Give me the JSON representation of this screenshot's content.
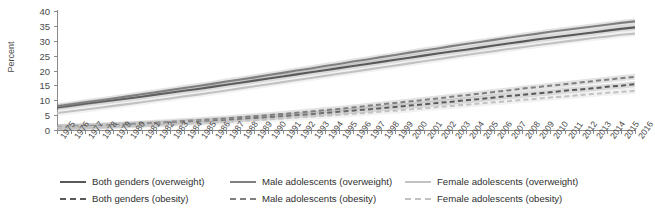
{
  "chart_data": {
    "type": "line",
    "title": "",
    "subtitle": "",
    "xlabel": "",
    "ylabel": "Percent",
    "ylim": [
      0,
      40
    ],
    "ytick_values": [
      0,
      5,
      10,
      15,
      20,
      25,
      30,
      35,
      40
    ],
    "grid": false,
    "legend_position": "bottom",
    "x": [
      1975,
      1976,
      1977,
      1978,
      1979,
      1980,
      1981,
      1982,
      1983,
      1984,
      1985,
      1986,
      1987,
      1988,
      1989,
      1990,
      1991,
      1992,
      1993,
      1994,
      1995,
      1996,
      1997,
      1998,
      1999,
      2000,
      2001,
      2002,
      2003,
      2004,
      2005,
      2006,
      2007,
      2008,
      2009,
      2010,
      2011,
      2012,
      2013,
      2014,
      2015,
      2016
    ],
    "categories": [
      "1975",
      "1976",
      "1977",
      "1978",
      "1979",
      "1980",
      "1981",
      "1982",
      "1983",
      "1984",
      "1985",
      "1986",
      "1987",
      "1988",
      "1989",
      "1990",
      "1991",
      "1992",
      "1993",
      "1994",
      "1995",
      "1996",
      "1997",
      "1998",
      "1999",
      "2000",
      "2001",
      "2002",
      "2003",
      "2004",
      "2005",
      "2006",
      "2007",
      "2008",
      "2009",
      "2010",
      "2011",
      "2012",
      "2013",
      "2014",
      "2015",
      "2016"
    ],
    "series": [
      {
        "name": "Both genders (overweight)",
        "style": "solid",
        "color": "#595959",
        "values": [
          7.6,
          8.2,
          8.8,
          9.4,
          10.0,
          10.6,
          11.2,
          11.9,
          12.5,
          13.2,
          13.8,
          14.5,
          15.2,
          15.9,
          16.6,
          17.3,
          18.0,
          18.7,
          19.4,
          20.1,
          20.8,
          21.5,
          22.2,
          22.9,
          23.6,
          24.3,
          25.0,
          25.7,
          26.4,
          27.0,
          27.7,
          28.4,
          29.1,
          29.7,
          30.4,
          31.0,
          31.6,
          32.2,
          32.8,
          33.4,
          34.0,
          34.5
        ]
      },
      {
        "name": "Male adolescents (overweight)",
        "style": "solid",
        "color": "#7f7f7f",
        "values": [
          8.0,
          8.6,
          9.3,
          9.9,
          10.6,
          11.3,
          12.0,
          12.7,
          13.4,
          14.1,
          14.8,
          15.5,
          16.3,
          17.0,
          17.7,
          18.5,
          19.2,
          20.0,
          20.7,
          21.5,
          22.2,
          23.0,
          23.7,
          24.5,
          25.2,
          26.0,
          26.7,
          27.4,
          28.2,
          28.9,
          29.6,
          30.3,
          31.0,
          31.7,
          32.3,
          33.0,
          33.6,
          34.2,
          34.8,
          35.4,
          36.0,
          36.5
        ]
      },
      {
        "name": "Female adolescents (overweight)",
        "style": "solid",
        "color": "#c2c2c2",
        "values": [
          5.7,
          6.3,
          6.9,
          7.5,
          8.1,
          8.7,
          9.3,
          10.0,
          10.6,
          11.3,
          11.9,
          12.6,
          13.3,
          14.0,
          14.7,
          15.4,
          16.1,
          16.8,
          17.5,
          18.2,
          18.9,
          19.6,
          20.3,
          21.0,
          21.7,
          22.4,
          23.1,
          23.8,
          24.5,
          25.2,
          25.9,
          26.5,
          27.2,
          27.8,
          28.5,
          29.1,
          29.7,
          30.3,
          30.9,
          31.4,
          32.0,
          32.4
        ]
      },
      {
        "name": "Both genders (obesity)",
        "style": "dashed",
        "color": "#595959",
        "values": [
          0.9,
          1.0,
          1.2,
          1.3,
          1.5,
          1.7,
          1.9,
          2.1,
          2.3,
          2.6,
          2.8,
          3.1,
          3.4,
          3.7,
          4.0,
          4.3,
          4.6,
          5.0,
          5.3,
          5.7,
          6.1,
          6.5,
          6.9,
          7.3,
          7.7,
          8.2,
          8.6,
          9.1,
          9.5,
          10.0,
          10.4,
          10.9,
          11.4,
          11.8,
          12.3,
          12.7,
          13.2,
          13.6,
          14.0,
          14.5,
          14.9,
          15.4
        ]
      },
      {
        "name": "Male adolescents (obesity)",
        "style": "dashed",
        "color": "#7f7f7f",
        "values": [
          1.0,
          1.2,
          1.3,
          1.5,
          1.7,
          1.9,
          2.2,
          2.4,
          2.7,
          3.0,
          3.3,
          3.6,
          3.9,
          4.3,
          4.6,
          5.0,
          5.4,
          5.8,
          6.2,
          6.7,
          7.1,
          7.6,
          8.1,
          8.6,
          9.1,
          9.6,
          10.1,
          10.6,
          11.2,
          11.7,
          12.2,
          12.8,
          13.3,
          13.9,
          14.4,
          14.9,
          15.4,
          15.9,
          16.4,
          16.9,
          17.4,
          17.9
        ]
      },
      {
        "name": "Female adolescents (obesity)",
        "style": "dashed",
        "color": "#c2c2c2",
        "values": [
          0.8,
          0.9,
          1.0,
          1.1,
          1.3,
          1.4,
          1.6,
          1.8,
          2.0,
          2.2,
          2.4,
          2.6,
          2.8,
          3.1,
          3.3,
          3.6,
          3.9,
          4.2,
          4.5,
          4.8,
          5.1,
          5.5,
          5.8,
          6.2,
          6.5,
          6.9,
          7.3,
          7.7,
          8.1,
          8.5,
          8.9,
          9.3,
          9.7,
          10.1,
          10.5,
          10.9,
          11.3,
          11.7,
          12.1,
          12.5,
          12.8,
          13.2
        ]
      }
    ]
  },
  "legend": {
    "items": [
      {
        "label": "Both genders (overweight)",
        "style": "solid",
        "color": "#595959"
      },
      {
        "label": "Male adolescents (overweight)",
        "style": "solid",
        "color": "#7f7f7f"
      },
      {
        "label": "Female adolescents (overweight)",
        "style": "solid",
        "color": "#c2c2c2"
      },
      {
        "label": "Both genders (obesity)",
        "style": "dashed",
        "color": "#595959"
      },
      {
        "label": "Male adolescents (obesity)",
        "style": "dashed",
        "color": "#7f7f7f"
      },
      {
        "label": "Female adolescents (obesity)",
        "style": "dashed",
        "color": "#c2c2c2"
      }
    ]
  }
}
